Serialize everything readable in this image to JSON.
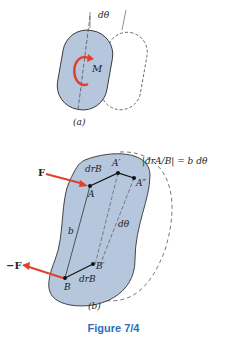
{
  "figure": {
    "caption": "Figure 7/4",
    "caption_color": "#2f6db8",
    "body_fill": "#b5c6dd",
    "arrow_color": "#e0402e",
    "panel_a": {
      "label": "(a)",
      "moment_label": "M",
      "angle_label": "dθ"
    },
    "panel_b": {
      "label": "(b)",
      "force_label": "F",
      "neg_force_label": "−F",
      "point_A": "A",
      "point_A_prime": "A′",
      "point_A_dprime": "A″",
      "point_B": "B",
      "point_B_prime": "B′",
      "dr_B_top": "drB",
      "dr_B_bottom": "drB",
      "length_b": "b",
      "angle_label": "dθ",
      "equation": "|drA/B| = b dθ"
    }
  }
}
